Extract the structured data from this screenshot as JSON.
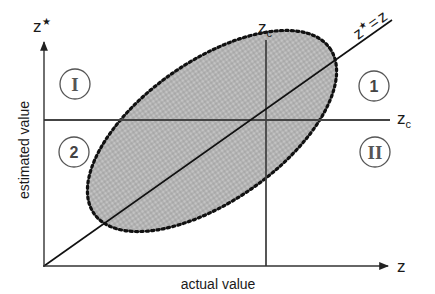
{
  "diagram": {
    "y_axis": {
      "symbol": "z",
      "superscript": "★",
      "label": "estimated value"
    },
    "x_axis": {
      "symbol": "z",
      "label": "actual value"
    },
    "cutoff_vertical": {
      "symbol": "z",
      "subscript": "c"
    },
    "cutoff_horizontal": {
      "symbol": "z",
      "subscript": "c"
    },
    "identity_line": {
      "label": "z★ = z",
      "lhs": "z",
      "star": "★",
      "eq": "=",
      "rhs": "z"
    },
    "quadrants": {
      "top_left": "I",
      "top_right": "1",
      "bottom_left": "2",
      "bottom_right": "II"
    },
    "colors": {
      "ellipse_fill": "#b5b5b5",
      "ellipse_border": "#111111",
      "axis": "#333333",
      "cutoff_line": "#444444",
      "circle_stroke": "#555555"
    }
  }
}
